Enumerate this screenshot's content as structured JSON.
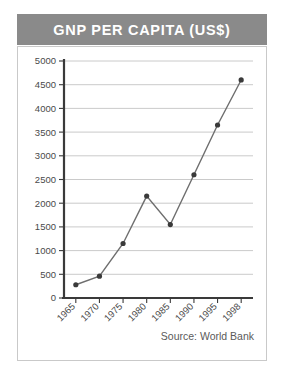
{
  "figure": {
    "title": "GNP PER CAPITA (US$)",
    "source_note": "Source: World Bank",
    "banner_color": "#8a8a8a",
    "banner_text_color": "#ffffff",
    "background_color": "#ffffff",
    "border_color": "#c9c9c9"
  },
  "chart_data": {
    "type": "line",
    "title": "GNP PER CAPITA (US$)",
    "xlabel": "",
    "ylabel": "",
    "categories": [
      "1965",
      "1970",
      "1975",
      "1980",
      "1985",
      "1990",
      "1995",
      "1998"
    ],
    "values": [
      280,
      460,
      1150,
      2150,
      1550,
      2600,
      3650,
      4600
    ],
    "series": [
      {
        "name": "GNP per capita (US$)",
        "values": [
          280,
          460,
          1150,
          2150,
          1550,
          2600,
          3650,
          4600
        ],
        "line_color": "#6e6e6e",
        "marker_color": "#3a3a3a"
      }
    ],
    "ylim": [
      0,
      5000
    ],
    "yticks": [
      0,
      500,
      1000,
      1500,
      2000,
      2500,
      3000,
      3500,
      4000,
      4500,
      5000
    ],
    "ytick_labels": [
      "0",
      "500",
      "1000",
      "1500",
      "2000",
      "2500",
      "3000",
      "3500",
      "4000",
      "4500",
      "5000"
    ],
    "xtick_labels": [
      "1965",
      "1970",
      "1975",
      "1980",
      "1985",
      "1990",
      "1995",
      "1998"
    ],
    "xtick_rotation": -45,
    "grid": true,
    "grid_axis": "y",
    "grid_color": "#bdbdbd",
    "legend": false,
    "annotations": [
      "Source: World Bank"
    ]
  }
}
